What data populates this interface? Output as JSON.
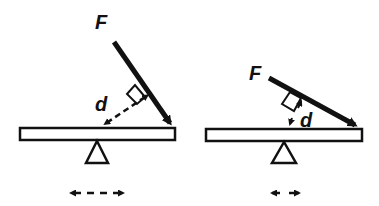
{
  "diagram": {
    "colors": {
      "stroke": "#111111",
      "background": "#ffffff"
    },
    "panels": [
      {
        "id": "left",
        "force_label": "F",
        "lever_arm_label": "d",
        "force_angle": "steep",
        "lever_arm_size": "long"
      },
      {
        "id": "right",
        "force_label": "F",
        "lever_arm_label": "d",
        "force_angle": "shallow",
        "lever_arm_size": "short"
      }
    ]
  }
}
